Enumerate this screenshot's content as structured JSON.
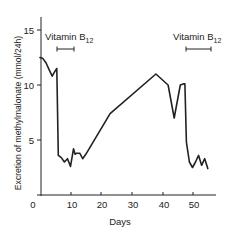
{
  "chart_data": {
    "type": "line",
    "title": "",
    "xlabel": "Days",
    "ylabel": "Excretion of methylmalonate (mmol/24h)",
    "xlim": [
      0,
      57
    ],
    "ylim": [
      0,
      16
    ],
    "x_ticks": [
      0,
      10,
      20,
      30,
      40,
      50
    ],
    "y_ticks": [
      5,
      10,
      15
    ],
    "grid": false,
    "legend": null,
    "series": [
      {
        "name": "Methylmalonate excretion",
        "x": [
          0,
          1,
          2,
          3,
          4,
          5,
          5.5,
          6,
          7,
          8,
          9,
          10,
          11,
          11.5,
          12,
          13,
          14,
          15,
          23,
          38,
          42,
          44,
          46,
          47,
          47.5,
          48,
          49,
          50,
          51,
          52,
          53,
          54,
          55
        ],
        "values": [
          12.5,
          12.4,
          12.0,
          11.4,
          10.8,
          11.3,
          11.5,
          3.6,
          3.4,
          3.0,
          3.3,
          2.6,
          4.2,
          3.7,
          3.8,
          3.8,
          3.3,
          3.7,
          7.4,
          11.0,
          10.0,
          7.0,
          10.0,
          10.1,
          10.1,
          4.8,
          3.0,
          2.5,
          3.0,
          3.6,
          2.7,
          3.3,
          2.4
        ]
      }
    ],
    "annotations": [
      {
        "text_main": "Vitamin B",
        "text_sub": "12",
        "x_range": [
          6,
          12
        ],
        "label_x": 1,
        "y": 13.3
      },
      {
        "text_main": "Vitamin B",
        "text_sub": "12",
        "x_range": [
          47,
          55
        ],
        "label_x": 45,
        "y": 13.3
      }
    ]
  },
  "labels": {
    "x_axis": "Days",
    "y_axis": "Excretion of methylmalonate (mmol/24h)",
    "x_ticks": [
      "0",
      "10",
      "20",
      "30",
      "40",
      "50"
    ],
    "y_ticks": [
      "5",
      "10",
      "15"
    ],
    "annot1_main": "Vitamin B",
    "annot1_sub": "12",
    "annot2_main": "Vitamin B",
    "annot2_sub": "12"
  }
}
